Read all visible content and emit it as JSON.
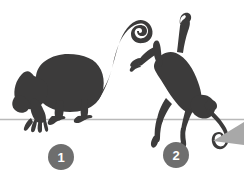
{
  "figure": {
    "background_color": "#ffffff",
    "silhouette_color": "#3c3b3b",
    "ground_line_color": "#b9b9b9",
    "badge_fill_color": "#6e6e6e",
    "badge_text_color": "#ffffff",
    "wedge_color": "#a8a8a8",
    "ground_line_y": 119
  },
  "subjects": [
    {
      "id": "monkey-1",
      "label": "1",
      "pose": "crouching on ground, tail curled upward",
      "badge": {
        "cx": 61,
        "cy": 157,
        "r": 13
      }
    },
    {
      "id": "monkey-2",
      "label": "2",
      "pose": "leaping head-down, arms raised, tail trailing",
      "badge": {
        "cx": 176,
        "cy": 155,
        "r": 13
      }
    }
  ],
  "annotations": {
    "wedge": {
      "name": "corner-wedge",
      "description": "light gray triangular wedge at lower right edge"
    }
  }
}
